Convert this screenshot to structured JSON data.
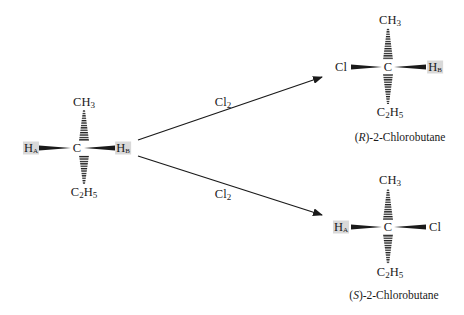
{
  "reactant": {
    "center": "C",
    "top": {
      "base": "CH",
      "sub": "3",
      "tail": ""
    },
    "bottom": {
      "base": "C",
      "sub": "2",
      "mid": "H",
      "sub2": "5"
    },
    "left": {
      "base": "H",
      "sub": "A"
    },
    "right": {
      "base": "H",
      "sub": "B"
    }
  },
  "arrows": [
    {
      "reagent_base": "Cl",
      "reagent_sub": "2"
    },
    {
      "reagent_base": "Cl",
      "reagent_sub": "2"
    }
  ],
  "products": [
    {
      "center": "C",
      "top": {
        "base": "CH",
        "sub": "3"
      },
      "bottom": {
        "base": "C",
        "sub": "2",
        "mid": "H",
        "sub2": "5"
      },
      "left": {
        "text": "Cl"
      },
      "right": {
        "base": "H",
        "sub": "B"
      },
      "name_config": "R",
      "name_prefix": "(",
      "name_suffix": ")-2-Chlorobutane"
    },
    {
      "center": "C",
      "top": {
        "base": "CH",
        "sub": "3"
      },
      "bottom": {
        "base": "C",
        "sub": "2",
        "mid": "H",
        "sub2": "5"
      },
      "left": {
        "base": "H",
        "sub": "A"
      },
      "right": {
        "text": "Cl"
      },
      "name_config": "S",
      "name_prefix": "(",
      "name_suffix": ")-2-Chlorobutane"
    }
  ],
  "colors": {
    "ink": "#1a1a1a",
    "highlight": "#d9d9d9",
    "background": "#ffffff"
  }
}
